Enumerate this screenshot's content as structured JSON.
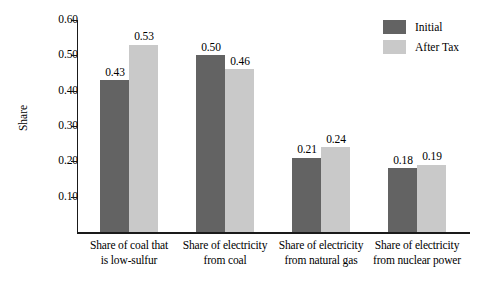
{
  "chart_data": {
    "type": "bar",
    "title": "",
    "xlabel": "",
    "ylabel": "Share",
    "ylim": [
      0.0,
      0.6
    ],
    "ytick_labels": [
      "0.60",
      "0.50",
      "0.40",
      "0.30",
      "0.20",
      "0.10"
    ],
    "ytick_values": [
      0.6,
      0.5,
      0.4,
      0.3,
      0.2,
      0.1
    ],
    "grid": false,
    "legend_position": "top-right",
    "categories": [
      "Share of coal that is low-sulfur",
      "Share of electricity from coal",
      "Share of electricity from natural gas",
      "Share of electricity from nuclear power"
    ],
    "category_lines": [
      [
        "Share of coal that",
        "is low-sulfur"
      ],
      [
        "Share of electricity",
        "from coal"
      ],
      [
        "Share of electricity",
        "from natural gas"
      ],
      [
        "Share of electricity",
        "from nuclear power"
      ]
    ],
    "series": [
      {
        "name": "Initial",
        "color": "#636363",
        "values": [
          0.43,
          0.5,
          0.21,
          0.18
        ],
        "labels": [
          "0.43",
          "0.50",
          "0.21",
          "0.18"
        ]
      },
      {
        "name": "After Tax",
        "color": "#c9c9c9",
        "values": [
          0.53,
          0.46,
          0.24,
          0.19
        ],
        "labels": [
          "0.53",
          "0.46",
          "0.24",
          "0.19"
        ]
      }
    ]
  },
  "legend": {
    "items": [
      {
        "label": "Initial",
        "color": "#636363"
      },
      {
        "label": "After Tax",
        "color": "#c9c9c9"
      }
    ]
  },
  "axis": {
    "y_title": "Share"
  }
}
